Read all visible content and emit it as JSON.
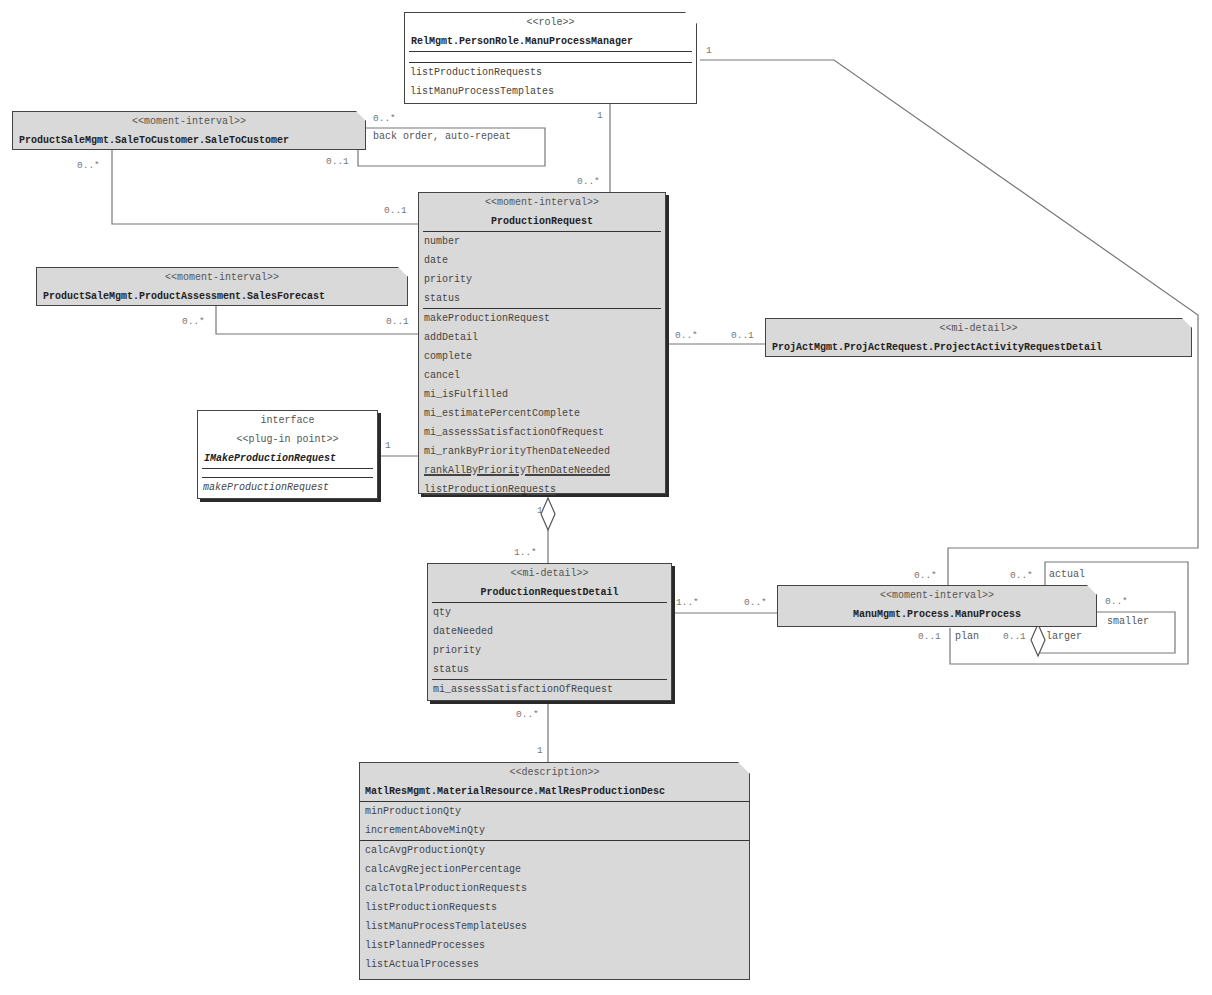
{
  "diagram": {
    "type": "UML class diagram",
    "classes": {
      "manu_process_manager": {
        "stereotype": "<<role>>",
        "name": "RelMgmt.PersonRole.ManuProcessManager",
        "attributes": [],
        "methods": [
          "listProductionRequests",
          "listManuProcessTemplates"
        ]
      },
      "sale_to_customer": {
        "stereotype": "<<moment-interval>>",
        "name": "ProductSaleMgmt.SaleToCustomer.SaleToCustomer"
      },
      "sales_forecast": {
        "stereotype": "<<moment-interval>>",
        "name": "ProductSaleMgmt.ProductAssessment.SalesForecast"
      },
      "production_request": {
        "stereotype": "<<moment-interval>>",
        "name": "ProductionRequest",
        "attributes": [
          "number",
          "date",
          "priority",
          "status"
        ],
        "methods": [
          "makeProductionRequest",
          "addDetail",
          "complete",
          "cancel",
          "mi_isFulfilled",
          "mi_estimatePercentComplete",
          "mi_assessSatisfactionOfRequest",
          "mi_rankByPriorityThenDateNeeded",
          "rankAllByPriorityThenDateNeeded",
          "listProductionRequests"
        ]
      },
      "make_production_request_iface": {
        "kind": "interface",
        "stereotype": "<<plug-in point>>",
        "name": "IMakeProductionRequest",
        "methods": [
          "makeProductionRequest"
        ]
      },
      "project_activity_request_detail": {
        "stereotype": "<<mi-detail>>",
        "name": "ProjActMgmt.ProjActRequest.ProjectActivityRequestDetail"
      },
      "production_request_detail": {
        "stereotype": "<<mi-detail>>",
        "name": "ProductionRequestDetail",
        "attributes": [
          "qty",
          "dateNeeded",
          "priority",
          "status"
        ],
        "methods": [
          "mi_assessSatisfactionOfRequest"
        ]
      },
      "manu_process": {
        "stereotype": "<<moment-interval>>",
        "name": "ManuMgmt.Process.ManuProcess"
      },
      "matl_res_production_desc": {
        "stereotype": "<<description>>",
        "name": "MatlResMgmt.MaterialResource.MatlResProductionDesc",
        "attributes": [
          "minProductionQty",
          "incrementAboveMinQty"
        ],
        "methods": [
          "calcAvgProductionQty",
          "calcAvgRejectionPercentage",
          "calcTotalProductionRequests",
          "listProductionRequests",
          "listManuProcessTemplateUses",
          "listPlannedProcesses",
          "listActualProcesses"
        ]
      }
    },
    "labels": {
      "m_role_right": "1",
      "m_role_bottom": "1",
      "m_pr_top": "0..*",
      "m_stc_self_a": "0..*",
      "m_stc_self_b": "0..1",
      "stc_self_role": "back order, auto-repeat",
      "m_stc_left": "0..*",
      "m_pr_stc": "0..1",
      "m_sf": "0..*",
      "m_pr_sf": "0..1",
      "m_pr_proj": "0..*",
      "m_proj": "0..1",
      "m_iface": "1",
      "m_pr_agg": "1",
      "m_prd_top": "1..*",
      "m_prd_right": "1..*",
      "m_mp_left": "0..*",
      "m_mp_top_a": "0..*",
      "m_mp_top_b": "0..*",
      "role_actual": "actual",
      "m_mp_right": "0..*",
      "role_smaller": "smaller",
      "m_mp_plan": "0..1",
      "role_plan": "plan",
      "m_mp_larger": "0..1",
      "role_larger": "larger",
      "m_prd_bottom": "0..*",
      "m_matl_top": "1"
    }
  }
}
